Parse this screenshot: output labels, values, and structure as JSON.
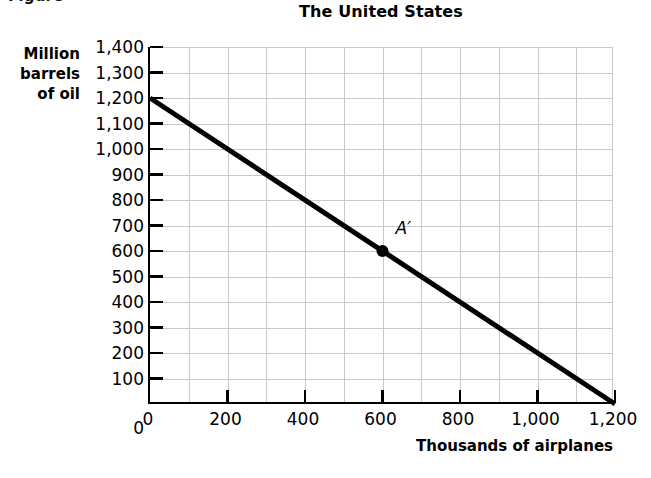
{
  "figure": {
    "caption": "Figure"
  },
  "chart_data": {
    "type": "line",
    "title": "The United States",
    "xlabel": "Thousands of airplanes",
    "ylabel": "Million barrels of oil",
    "ylabel_lines": [
      "Million",
      "barrels",
      "of oil"
    ],
    "xlim": [
      0,
      1200
    ],
    "ylim": [
      0,
      1400
    ],
    "grid": true,
    "grid_color": "#c9c9c9",
    "line_color": "#000000",
    "legend": "none",
    "xticks": [
      0,
      200,
      400,
      600,
      800,
      1000,
      1200
    ],
    "xticklabels": [
      "0",
      "200",
      "400",
      "600",
      "800",
      "1,000",
      "1,200"
    ],
    "yticks": [
      0,
      100,
      200,
      300,
      400,
      500,
      600,
      700,
      800,
      900,
      1000,
      1100,
      1200,
      1300,
      1400
    ],
    "yticklabels": [
      "0",
      "100",
      "200",
      "300",
      "400",
      "500",
      "600",
      "700",
      "800",
      "900",
      "1,000",
      "1,100",
      "1,200",
      "1,300",
      "1,400"
    ],
    "series": [
      {
        "name": "Production possibilities frontier",
        "x": [
          0,
          1200
        ],
        "values": [
          1200,
          0
        ]
      }
    ],
    "annotations": [
      {
        "label": "A′",
        "x": 600,
        "y": 600,
        "marker": "filled-circle"
      }
    ]
  }
}
